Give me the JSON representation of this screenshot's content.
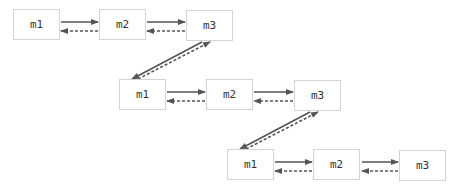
{
  "diagram": {
    "rows": [
      {
        "nodes": [
          {
            "id": "r1m1",
            "label": "m1"
          },
          {
            "id": "r1m2",
            "label": "m2"
          },
          {
            "id": "r1m3",
            "label": "m3"
          }
        ]
      },
      {
        "nodes": [
          {
            "id": "r2m1",
            "label": "m1"
          },
          {
            "id": "r2m2",
            "label": "m2"
          },
          {
            "id": "r2m3",
            "label": "m3"
          }
        ]
      },
      {
        "nodes": [
          {
            "id": "r3m1",
            "label": "m1"
          },
          {
            "id": "r3m2",
            "label": "m2"
          },
          {
            "id": "r3m3",
            "label": "m3"
          }
        ]
      }
    ],
    "edge_styles": {
      "forward": "solid",
      "backward": "dashed"
    },
    "colors": {
      "arrow": "#555555",
      "node_border": "#d4d4d4",
      "text": "#333333"
    }
  }
}
